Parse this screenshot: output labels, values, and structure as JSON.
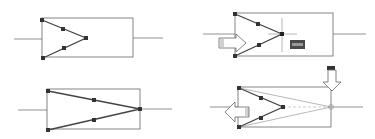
{
  "figure": {
    "background": "#ffffff",
    "stroke_color": "#555555",
    "grip_color": "#333333",
    "label_box_color": "#4a4a4a",
    "panels": [
      {
        "id": "panel-1",
        "step": "Initial triangle with grips"
      },
      {
        "id": "panel-2",
        "step": "Grip selected with crosshair and label, right arrow"
      },
      {
        "id": "panel-3",
        "step": "Triangle tip stretched to right edge"
      },
      {
        "id": "panel-4",
        "step": "Rubber-band preview with down and left arrows"
      }
    ]
  }
}
